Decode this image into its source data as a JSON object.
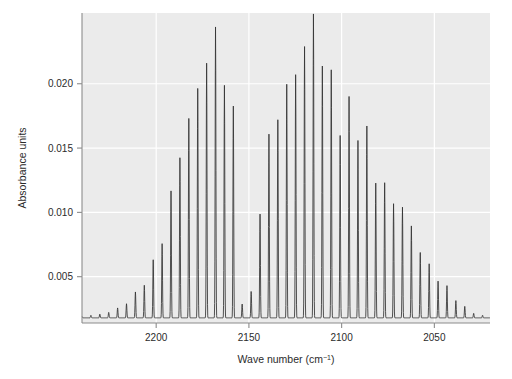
{
  "chart_data": {
    "type": "line",
    "title": "",
    "xlabel": "Wave number (cm⁻¹)",
    "ylabel": "Absorbance units",
    "xlim": [
      2240,
      2020
    ],
    "ylim": [
      0.0014,
      0.0255
    ],
    "x_reversed": true,
    "grid": true,
    "legend_position": "none",
    "xticks": [
      2200,
      2150,
      2100,
      2050
    ],
    "xtick_labels": [
      "2200",
      "2150",
      "2100",
      "2050"
    ],
    "yticks": [
      0.005,
      0.01,
      0.015,
      0.02
    ],
    "ytick_labels": [
      "0.005",
      "0.010",
      "0.015",
      "0.020"
    ],
    "line_color": "#333333",
    "panel_background": "#ebebeb",
    "grid_color": "#ffffff",
    "baseline": 0.0018,
    "line_spacing_cm1": 2.4,
    "bands": [
      {
        "name": "band-1",
        "center": 2176,
        "peak_value": 0.0244,
        "peak_wavenumber": 2172,
        "width": 38
      },
      {
        "name": "band-2",
        "center": 2112,
        "peak_value": 0.0228,
        "peak_wavenumber": 2116,
        "width": 40
      }
    ],
    "gap": {
      "wavenumber": 2152,
      "value": 0.0018
    },
    "series": [
      {
        "name": "absorbance",
        "color": "#333333",
        "envelope_points": [
          {
            "x": 2240,
            "y": 0.0019
          },
          {
            "x": 2230,
            "y": 0.0021
          },
          {
            "x": 2220,
            "y": 0.0026
          },
          {
            "x": 2212,
            "y": 0.0034
          },
          {
            "x": 2205,
            "y": 0.005
          },
          {
            "x": 2198,
            "y": 0.0074
          },
          {
            "x": 2192,
            "y": 0.0104
          },
          {
            "x": 2186,
            "y": 0.014
          },
          {
            "x": 2180,
            "y": 0.0185
          },
          {
            "x": 2174,
            "y": 0.0225
          },
          {
            "x": 2172,
            "y": 0.0244
          },
          {
            "x": 2168,
            "y": 0.0228
          },
          {
            "x": 2164,
            "y": 0.0215
          },
          {
            "x": 2160,
            "y": 0.019
          },
          {
            "x": 2156,
            "y": 0.015
          },
          {
            "x": 2152,
            "y": 0.0095
          },
          {
            "x": 2148,
            "y": 0.006
          },
          {
            "x": 2144,
            "y": 0.0105
          },
          {
            "x": 2138,
            "y": 0.015
          },
          {
            "x": 2132,
            "y": 0.0186
          },
          {
            "x": 2126,
            "y": 0.0208
          },
          {
            "x": 2120,
            "y": 0.0222
          },
          {
            "x": 2116,
            "y": 0.0228
          },
          {
            "x": 2110,
            "y": 0.022
          },
          {
            "x": 2104,
            "y": 0.0205
          },
          {
            "x": 2096,
            "y": 0.0182
          },
          {
            "x": 2088,
            "y": 0.0158
          },
          {
            "x": 2080,
            "y": 0.0132
          },
          {
            "x": 2072,
            "y": 0.0108
          },
          {
            "x": 2064,
            "y": 0.0086
          },
          {
            "x": 2056,
            "y": 0.0066
          },
          {
            "x": 2048,
            "y": 0.005
          },
          {
            "x": 2042,
            "y": 0.0038
          },
          {
            "x": 2036,
            "y": 0.0029
          },
          {
            "x": 2030,
            "y": 0.0023
          },
          {
            "x": 2024,
            "y": 0.002
          },
          {
            "x": 2020,
            "y": 0.0019
          }
        ]
      }
    ]
  }
}
